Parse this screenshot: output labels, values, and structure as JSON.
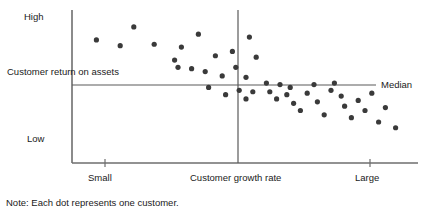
{
  "chart_data": {
    "type": "scatter",
    "title": "",
    "xlabel": "Customer growth rate",
    "ylabel": "Customer return on assets",
    "note": "Note: Each dot represents one customer.",
    "grid": false,
    "legend": "none",
    "x_tick_labels": [
      "Small",
      "Large"
    ],
    "y_tick_labels": [
      "High",
      "Low"
    ],
    "median_label": "Median",
    "xlim": [
      0,
      100
    ],
    "ylim": [
      0,
      100
    ],
    "x_median": 55,
    "y_median": 51,
    "dot_color": "#3a3a3a",
    "axis_color": "#6e6e6e",
    "points": [
      {
        "x": 6,
        "y": 82
      },
      {
        "x": 13,
        "y": 78
      },
      {
        "x": 17,
        "y": 91
      },
      {
        "x": 23,
        "y": 79
      },
      {
        "x": 29,
        "y": 68
      },
      {
        "x": 31,
        "y": 77
      },
      {
        "x": 30,
        "y": 63
      },
      {
        "x": 34,
        "y": 62
      },
      {
        "x": 38,
        "y": 60
      },
      {
        "x": 36,
        "y": 86
      },
      {
        "x": 41,
        "y": 71
      },
      {
        "x": 43,
        "y": 57
      },
      {
        "x": 46,
        "y": 74
      },
      {
        "x": 47,
        "y": 63
      },
      {
        "x": 50,
        "y": 56
      },
      {
        "x": 51,
        "y": 84
      },
      {
        "x": 53,
        "y": 70
      },
      {
        "x": 52,
        "y": 46
      },
      {
        "x": 39,
        "y": 49
      },
      {
        "x": 44,
        "y": 44
      },
      {
        "x": 48,
        "y": 47
      },
      {
        "x": 50,
        "y": 41
      },
      {
        "x": 56,
        "y": 52
      },
      {
        "x": 57,
        "y": 46
      },
      {
        "x": 60,
        "y": 51
      },
      {
        "x": 59,
        "y": 41
      },
      {
        "x": 62,
        "y": 44
      },
      {
        "x": 64,
        "y": 38
      },
      {
        "x": 63,
        "y": 49
      },
      {
        "x": 66,
        "y": 33
      },
      {
        "x": 68,
        "y": 45
      },
      {
        "x": 70,
        "y": 51
      },
      {
        "x": 71,
        "y": 39
      },
      {
        "x": 73,
        "y": 30
      },
      {
        "x": 75,
        "y": 47
      },
      {
        "x": 76,
        "y": 52
      },
      {
        "x": 78,
        "y": 43
      },
      {
        "x": 79,
        "y": 36
      },
      {
        "x": 81,
        "y": 28
      },
      {
        "x": 83,
        "y": 40
      },
      {
        "x": 85,
        "y": 33
      },
      {
        "x": 87,
        "y": 45
      },
      {
        "x": 89,
        "y": 25
      },
      {
        "x": 91,
        "y": 35
      },
      {
        "x": 94,
        "y": 21
      }
    ]
  },
  "labels": {
    "high": "High",
    "low": "Low",
    "y_axis": "Customer return on assets",
    "small": "Small",
    "x_axis": "Customer growth rate",
    "large": "Large",
    "median": "Median",
    "note": "Note: Each dot represents one customer."
  }
}
